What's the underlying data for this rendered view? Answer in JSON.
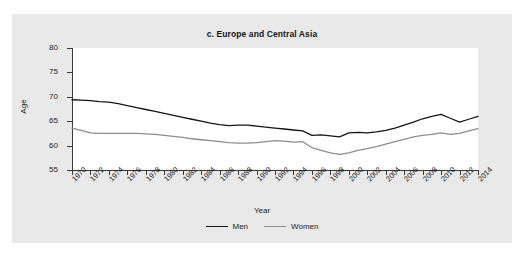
{
  "figure": {
    "cut_off_header_text": "",
    "panel_background": "#e9e9e9",
    "plot_background": "#ffffff"
  },
  "chart_data": {
    "type": "line",
    "title": "c. Europe and Central Asia",
    "xlabel": "Year",
    "ylabel": "Age",
    "ylim": [
      55,
      80
    ],
    "yticks": [
      55,
      60,
      65,
      70,
      75,
      80
    ],
    "xlim": [
      1970,
      2014
    ],
    "xticks": [
      1970,
      1972,
      1974,
      1976,
      1978,
      1980,
      1982,
      1984,
      1986,
      1988,
      1990,
      1992,
      1994,
      1996,
      1998,
      2000,
      2002,
      2004,
      2006,
      2008,
      2010,
      2012,
      2014
    ],
    "grid": false,
    "legend_position": "bottom",
    "x": [
      1970,
      1971,
      1972,
      1973,
      1974,
      1975,
      1976,
      1977,
      1978,
      1979,
      1980,
      1981,
      1982,
      1983,
      1984,
      1985,
      1986,
      1987,
      1988,
      1989,
      1990,
      1991,
      1992,
      1993,
      1994,
      1995,
      1996,
      1997,
      1998,
      1999,
      2000,
      2001,
      2002,
      2003,
      2004,
      2005,
      2006,
      2007,
      2008,
      2009,
      2010,
      2011,
      2012,
      2013,
      2014
    ],
    "series": [
      {
        "name": "Men",
        "color": "#151515",
        "values": [
          69.4,
          69.3,
          69.2,
          69.0,
          68.9,
          68.6,
          68.2,
          67.8,
          67.4,
          67.0,
          66.6,
          66.2,
          65.8,
          65.4,
          65.0,
          64.6,
          64.3,
          64.1,
          64.2,
          64.2,
          64.0,
          63.8,
          63.6,
          63.4,
          63.2,
          63.0,
          62.1,
          62.2,
          62.0,
          61.8,
          62.6,
          62.7,
          62.6,
          62.8,
          63.1,
          63.6,
          64.2,
          64.8,
          65.5,
          66.0,
          66.4,
          65.6,
          64.8,
          65.4,
          66.0
        ]
      },
      {
        "name": "Women",
        "color": "#8d8d8d",
        "values": [
          63.6,
          63.1,
          62.6,
          62.5,
          62.5,
          62.5,
          62.5,
          62.5,
          62.4,
          62.3,
          62.1,
          61.9,
          61.7,
          61.4,
          61.2,
          61.0,
          60.8,
          60.6,
          60.5,
          60.5,
          60.6,
          60.8,
          61.0,
          60.9,
          60.7,
          60.8,
          59.6,
          59.0,
          58.5,
          58.2,
          58.5,
          59.0,
          59.4,
          59.8,
          60.3,
          60.8,
          61.3,
          61.8,
          62.1,
          62.3,
          62.6,
          62.3,
          62.5,
          63.0,
          63.5
        ]
      }
    ]
  },
  "legend": {
    "items": [
      {
        "label": "Men",
        "color": "#151515"
      },
      {
        "label": "Women",
        "color": "#8d8d8d"
      }
    ]
  }
}
